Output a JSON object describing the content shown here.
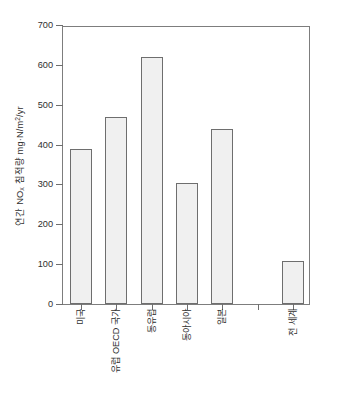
{
  "chart_data": {
    "type": "bar",
    "title": "",
    "xlabel": "",
    "ylabel": "연간 NOx 침적량 mg·N/m2/yr",
    "ylabel_parts": {
      "prefix": "연간 NO",
      "sub": "x",
      "mid": " 침적량 mg·N/m",
      "sup": "2",
      "suffix": "/yr"
    },
    "categories": [
      "미국",
      "유럽 OECD 국가",
      "동유럽",
      "동아시아",
      "일본",
      "",
      "전 세계"
    ],
    "values": [
      388,
      468,
      620,
      303,
      438,
      null,
      108
    ],
    "ylim": [
      0,
      700
    ],
    "yticks": [
      0,
      100,
      200,
      300,
      400,
      500,
      600,
      700
    ],
    "ytick_labels": [
      "0",
      "100",
      "200",
      "300",
      "400",
      "500",
      "600",
      "700"
    ],
    "grid": false,
    "legend": null,
    "bar_fill": "#f0f0f0",
    "bar_edge": "#6e6e6e",
    "axis_color": "#7d7d7d"
  }
}
